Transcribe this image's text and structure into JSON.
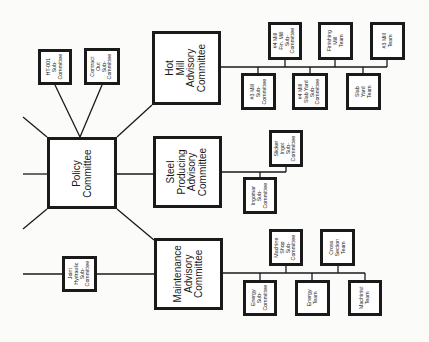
{
  "diagram": {
    "type": "organization-chart",
    "orientation": "rotated-90-ccw",
    "nodes": {
      "policy": {
        "label": "Policy\nCommittee"
      },
      "hot_mill": {
        "label": "Hot\nMill\nAdvisory\nCommittee"
      },
      "steel_producing": {
        "label": "Steel\nProducing\nAdvisory\nCommittee"
      },
      "maintenance": {
        "label": "Maintenance\nAdvisory\nCommittee"
      },
      "ht001": {
        "label": "HT-001\nSub-\nCommittee"
      },
      "contract_out": {
        "label": "Contract\nOut\nSub-\nCommittee"
      },
      "joint_hydraulic": {
        "label": "Joint\nHydraulic\nSub-\nCommittee"
      },
      "mill4_fin": {
        "label": "#4 Mill\nFin. Mill\nSub-\nCommittee"
      },
      "finishing_mill_team": {
        "label": "Finishing\nMill\nTeam"
      },
      "mill3_team": {
        "label": "#3 Mill\nTeam"
      },
      "mill3_sub": {
        "label": "#3 Mill\nSub-\nCommittee"
      },
      "mill4_slab": {
        "label": "#4 Mill\nSlab Yard\nSub-\nCommittee"
      },
      "slab_yard_team": {
        "label": "Slab\nYard\nTeam"
      },
      "slicker_ingot": {
        "label": "Slicker\nIngot\nSub-\nCommittee"
      },
      "ingomar": {
        "label": "Ingomar\nSub-\nCommittee"
      },
      "machine_shop": {
        "label": "Machine\nShop\nSub-\nCommittee"
      },
      "cross_section": {
        "label": "Cross\nSection\nTeam"
      },
      "energy_sub": {
        "label": "Energy\nSub-\nCommittee"
      },
      "energy_team": {
        "label": "Energy\nTeam"
      },
      "machinist_team": {
        "label": "Machinist\nTeam"
      }
    },
    "colors": {
      "line": "#1a1a1a",
      "background": "#fbfbf9"
    }
  }
}
